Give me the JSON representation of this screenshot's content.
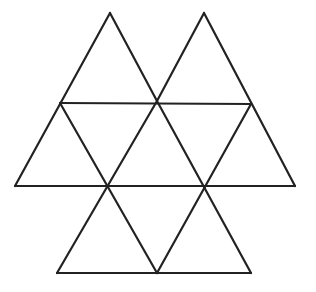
{
  "figure": {
    "stroke_color": "#222222",
    "stroke_width": 2.2,
    "background": "#ffffff",
    "segments": [
      {
        "name": "top-left-apex-left-side",
        "x1": 110,
        "y1": 13,
        "x2": 15,
        "y2": 186
      },
      {
        "name": "top-left-apex-right-side",
        "x1": 110,
        "y1": 13,
        "x2": 157,
        "y2": 101
      },
      {
        "name": "top-right-apex-left-side",
        "x1": 204,
        "y1": 13,
        "x2": 157,
        "y2": 101
      },
      {
        "name": "top-right-apex-right-side",
        "x1": 204,
        "y1": 13,
        "x2": 295,
        "y2": 186
      },
      {
        "name": "upper-horizontal",
        "x1": 60,
        "y1": 103,
        "x2": 251,
        "y2": 104
      },
      {
        "name": "middle-horizontal",
        "x1": 15,
        "y1": 186,
        "x2": 295,
        "y2": 186
      },
      {
        "name": "bottom-horizontal",
        "x1": 57,
        "y1": 273,
        "x2": 251,
        "y2": 273
      },
      {
        "name": "diag-a",
        "x1": 60,
        "y1": 103,
        "x2": 157,
        "y2": 273
      },
      {
        "name": "diag-b",
        "x1": 157,
        "y1": 101,
        "x2": 57,
        "y2": 273
      },
      {
        "name": "diag-c",
        "x1": 157,
        "y1": 101,
        "x2": 251,
        "y2": 273
      },
      {
        "name": "diag-d",
        "x1": 251,
        "y1": 104,
        "x2": 157,
        "y2": 273
      }
    ]
  }
}
